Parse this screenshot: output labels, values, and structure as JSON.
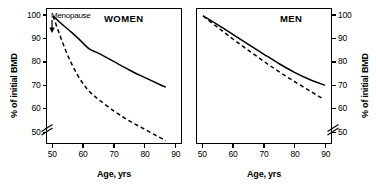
{
  "figure": {
    "background": "#ffffff",
    "line_color": "#000000"
  },
  "panels": [
    {
      "key": "women",
      "label": "WOMEN",
      "xlabel": "Age, yrs",
      "ylabel": "% of initial BMD",
      "annotation": "Menopause"
    },
    {
      "key": "men",
      "label": "MEN",
      "xlabel": "Age, yrs",
      "ylabel": "% of initial BMD"
    }
  ],
  "axis": {
    "yticks": [
      "100",
      "90",
      "80",
      "70",
      "60",
      "50"
    ],
    "xticks": [
      "50",
      "60",
      "70",
      "80",
      "90"
    ],
    "y_break": true,
    "ylim": [
      45,
      103
    ],
    "xlim": [
      48,
      92
    ]
  },
  "chart_data": {
    "type": "line",
    "title": "",
    "xlabel": "Age, yrs",
    "ylabel": "% of initial BMD",
    "xlim": [
      48,
      92
    ],
    "ylim": [
      45,
      103
    ],
    "yticks": [
      50,
      60,
      70,
      80,
      90,
      100
    ],
    "xticks": [
      50,
      60,
      70,
      80,
      90
    ],
    "axis_break_below_y": 50,
    "grid": false,
    "legend": "none",
    "panels": [
      {
        "name": "WOMEN",
        "annotations": [
          {
            "text": "Menopause",
            "x": 50,
            "y": 100,
            "arrow": "down"
          }
        ],
        "series": [
          {
            "name": "normal-bone-loss-women",
            "style": "solid",
            "x": [
              50,
              52,
              54,
              56,
              58,
              60,
              62,
              65,
              70,
              75,
              80,
              85,
              87
            ],
            "y": [
              100,
              97.5,
              95.2,
              93.0,
              90.6,
              88.0,
              85.6,
              83.8,
              80.2,
              76.6,
              73.4,
              70.3,
              69.2
            ]
          },
          {
            "name": "accelerated-bone-loss-women",
            "style": "dashed",
            "x": [
              50,
              52,
              54,
              56,
              58,
              60,
              62,
              65,
              70,
              75,
              80,
              85,
              87
            ],
            "y": [
              100,
              92.5,
              85.5,
              79.5,
              74.5,
              70.4,
              67.2,
              63.8,
              58.8,
              54.6,
              51.0,
              47.4,
              46.0
            ]
          }
        ]
      },
      {
        "name": "MEN",
        "annotations": [],
        "series": [
          {
            "name": "normal-bone-loss-men",
            "style": "solid",
            "x": [
              50,
              55,
              60,
              65,
              70,
              75,
              80,
              85,
              90
            ],
            "y": [
              100,
              96.0,
              91.8,
              87.6,
              83.4,
              79.3,
              75.6,
              72.5,
              70.0
            ]
          },
          {
            "name": "accelerated-bone-loss-men",
            "style": "dashed",
            "x": [
              50,
              55,
              60,
              65,
              70,
              75,
              80,
              85,
              89
            ],
            "y": [
              100,
              94.8,
              89.8,
              85.0,
              80.3,
              75.8,
              71.6,
              67.6,
              64.4
            ]
          }
        ]
      }
    ]
  }
}
